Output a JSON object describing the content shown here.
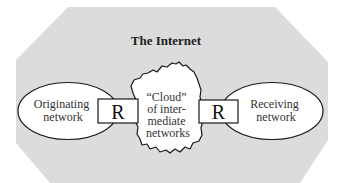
{
  "title": "The Internet",
  "nodes": {
    "originating": {
      "lines": [
        "Originating",
        "network"
      ]
    },
    "router_left": {
      "label": "R"
    },
    "cloud": {
      "lines": [
        "“Cloud”",
        "of inter-",
        "mediate",
        "networks"
      ]
    },
    "router_right": {
      "label": "R"
    },
    "receiving": {
      "lines": [
        "Receiving",
        "network"
      ]
    }
  },
  "colors": {
    "region_fill": "#dcdcdc",
    "shape_fill": "#ffffff",
    "stroke": "#1a1a1a",
    "text": "#222222"
  }
}
